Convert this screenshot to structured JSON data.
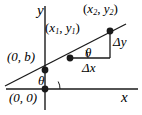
{
  "figure": {
    "width": 142,
    "height": 115,
    "background_color": "#ffffff",
    "ink_color": "#1a1a1a"
  },
  "axes": {
    "x_label": "x",
    "y_label": "y",
    "x_axis": {
      "y": 89,
      "x_start": 6,
      "x_end": 138
    },
    "y_axis": {
      "x": 45,
      "y_start": 6,
      "y_end": 110
    }
  },
  "labels": {
    "point2": {
      "open": "(",
      "x_sym": "x",
      "x_sub": "2",
      "comma": ", ",
      "y_sym": "y",
      "y_sub": "2",
      "close": ")"
    },
    "point1": {
      "open": "(",
      "x_sym": "x",
      "x_sub": "1",
      "comma": ", ",
      "y_sym": "y",
      "y_sub": "1",
      "close": ")"
    },
    "y_intercept": "(0, b)",
    "origin": "(0, 0)",
    "delta_y": "Δy",
    "delta_x": "Δx",
    "theta_origin": "θ",
    "theta_triangle": "θ"
  },
  "geometry": {
    "line": {
      "x1": 6,
      "y1": 85,
      "x2": 124,
      "y2": 25
    },
    "points": [
      {
        "name": "origin",
        "cx": 45,
        "cy": 89,
        "r": 3.2
      },
      {
        "name": "y-intercept",
        "cx": 45,
        "cy": 70,
        "r": 3.2
      },
      {
        "name": "point-1",
        "cx": 70,
        "cy": 58,
        "r": 3.2
      },
      {
        "name": "point-2",
        "cx": 110,
        "cy": 31,
        "r": 3.2
      }
    ],
    "triangle": {
      "horizontal": {
        "x1": 70,
        "y1": 58,
        "x2": 110,
        "y2": 58
      },
      "vertical": {
        "x1": 110,
        "y1": 58,
        "x2": 110,
        "y2": 31
      }
    },
    "angle_arcs": [
      {
        "name": "theta-at-origin",
        "vertex_x": 45,
        "vertex_y": 89,
        "radius": 14
      },
      {
        "name": "theta-in-triangle",
        "vertex_x": 70,
        "vertex_y": 58,
        "radius": 17
      }
    ]
  }
}
